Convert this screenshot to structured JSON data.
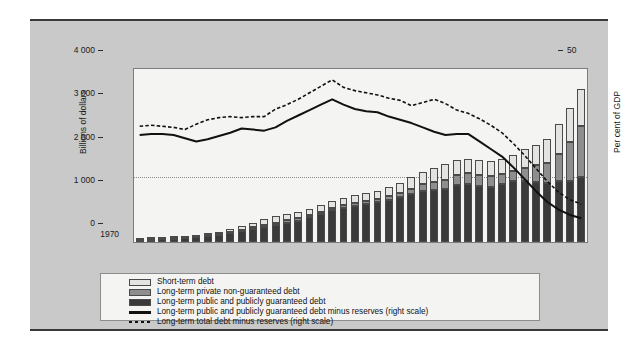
{
  "axes": {
    "left_title": "Billions of dollars",
    "right_title": "Per cent of GDP",
    "left_ticks": [
      "4 000",
      "3 000",
      "2 000",
      "1 000",
      "0"
    ],
    "right_ticks": [
      "50",
      "40",
      "30",
      "20",
      "10",
      "0",
      "-10",
      "-20",
      "-30"
    ],
    "x_ticks": [
      "1970",
      "1973",
      "1976",
      "1979",
      "1982",
      "1985",
      "1988",
      "1991",
      "1994",
      "1997",
      "2000",
      "2003",
      "2006",
      "2009"
    ]
  },
  "legend": {
    "items": [
      {
        "label": "Short-term debt",
        "swatch": "light-gray-swatch",
        "kind": "box",
        "color": "#e3e3e1"
      },
      {
        "label": "Long-term private non-guaranteed debt",
        "swatch": "medium-gray-swatch",
        "kind": "box",
        "color": "#8e8e8e"
      },
      {
        "label": "Long-term public and publicly guaranteed debt",
        "swatch": "dark-gray-swatch",
        "kind": "box",
        "color": "#3a3a3a"
      },
      {
        "label": "Long-term public and publicly guaranteed debt minus reserves (right scale)",
        "swatch": "solid-line-swatch",
        "kind": "solid",
        "color": "#111111"
      },
      {
        "label": "Long-term total debt minus reserves (right scale)",
        "swatch": "dashed-line-swatch",
        "kind": "dashed",
        "color": "#111111"
      }
    ]
  },
  "chart_data": {
    "type": "bar",
    "title": "",
    "xlabel": "",
    "ylabel": "Billions of dollars",
    "y2label": "Per cent of GDP",
    "ylim": [
      0,
      4000
    ],
    "y2lim": [
      -30,
      50
    ],
    "grid": true,
    "legend_position": "bottom",
    "x": [
      1970,
      1971,
      1972,
      1973,
      1974,
      1975,
      1976,
      1977,
      1978,
      1979,
      1980,
      1981,
      1982,
      1983,
      1984,
      1985,
      1986,
      1987,
      1988,
      1989,
      1990,
      1991,
      1992,
      1993,
      1994,
      1995,
      1996,
      1997,
      1998,
      1999,
      2000,
      2001,
      2002,
      2003,
      2004,
      2005,
      2006,
      2007,
      2008,
      2009
    ],
    "series": [
      {
        "name": "Long-term public and publicly guaranteed debt",
        "axis": "left",
        "color": "#3a3a3a",
        "stacked": true,
        "values": [
          45,
          52,
          60,
          72,
          90,
          110,
          135,
          165,
          200,
          245,
          300,
          345,
          400,
          450,
          495,
          570,
          650,
          730,
          790,
          830,
          880,
          920,
          980,
          1030,
          1100,
          1180,
          1210,
          1230,
          1310,
          1340,
          1300,
          1280,
          1330,
          1400,
          1420,
          1390,
          1360,
          1400,
          1420,
          1500
        ]
      },
      {
        "name": "Long-term private non-guaranteed debt",
        "axis": "left",
        "color": "#8e8e8e",
        "stacked": true,
        "values": [
          8,
          9,
          10,
          12,
          14,
          16,
          19,
          22,
          26,
          30,
          36,
          42,
          48,
          50,
          50,
          50,
          52,
          54,
          58,
          62,
          66,
          70,
          82,
          98,
          125,
          150,
          175,
          205,
          240,
          250,
          250,
          245,
          240,
          250,
          300,
          380,
          470,
          640,
          900,
          1180
        ]
      },
      {
        "name": "Short-term debt",
        "axis": "left",
        "color": "#e3e3e1",
        "stacked": true,
        "values": [
          12,
          14,
          16,
          20,
          26,
          34,
          44,
          56,
          70,
          90,
          115,
          135,
          160,
          150,
          140,
          150,
          160,
          170,
          180,
          185,
          190,
          195,
          215,
          240,
          270,
          300,
          330,
          360,
          350,
          330,
          340,
          345,
          340,
          360,
          420,
          480,
          560,
          680,
          780,
          860
        ]
      },
      {
        "name": "Long-term public and publicly guaranteed debt minus reserves (right scale)",
        "axis": "right",
        "color": "#111111",
        "style": "solid",
        "values": [
          19.5,
          20.0,
          20.0,
          19.5,
          18.0,
          16.5,
          17.5,
          19.0,
          20.5,
          22.5,
          22.0,
          21.5,
          23.0,
          26.0,
          28.5,
          31.0,
          33.5,
          36.0,
          33.5,
          31.5,
          30.5,
          30.0,
          28.0,
          26.5,
          25.0,
          23.0,
          21.0,
          19.5,
          20.0,
          20.0,
          16.5,
          13.0,
          9.5,
          4.5,
          -1.0,
          -6.5,
          -11.5,
          -15.0,
          -17.5,
          -19.0
        ]
      },
      {
        "name": "Long-term total debt minus reserves (right scale)",
        "axis": "right",
        "color": "#111111",
        "style": "dashed",
        "values": [
          23.5,
          24.0,
          23.5,
          23.0,
          22.0,
          24.5,
          26.5,
          27.5,
          28.0,
          27.5,
          28.0,
          28.0,
          31.5,
          33.5,
          36.0,
          39.0,
          42.0,
          45.0,
          41.5,
          40.0,
          39.0,
          38.0,
          36.5,
          35.5,
          33.0,
          34.5,
          36.0,
          34.0,
          31.0,
          29.5,
          27.0,
          24.0,
          20.5,
          15.5,
          10.0,
          4.0,
          -2.0,
          -7.0,
          -10.5,
          -12.5
        ]
      }
    ]
  }
}
